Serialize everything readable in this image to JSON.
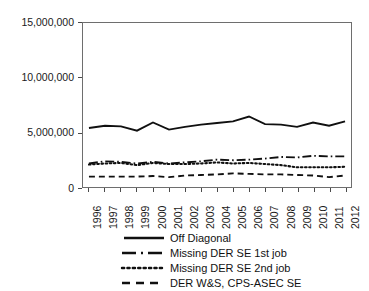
{
  "chart_data": {
    "type": "line",
    "title": "",
    "xlabel": "",
    "ylabel": "",
    "grid": false,
    "legend_position": "bottom",
    "x": [
      1996,
      1997,
      1998,
      1999,
      2000,
      2001,
      2002,
      2003,
      2004,
      2005,
      2006,
      2007,
      2008,
      2009,
      2010,
      2011,
      2012
    ],
    "categories": [
      "1996",
      "1997",
      "1998",
      "1999",
      "2000",
      "2001",
      "2002",
      "2003",
      "2004",
      "2005",
      "2006",
      "2007",
      "2008",
      "2009",
      "2010",
      "2011",
      "2012"
    ],
    "ylim": [
      0,
      15000000
    ],
    "yticks": [
      0,
      5000000,
      10000000,
      15000000
    ],
    "ytick_labels": [
      "0",
      "5,000,000",
      "10,000,000",
      "15,000,000"
    ],
    "series": [
      {
        "name": "Off Diagonal",
        "style": "solid",
        "values": [
          5400000,
          5600000,
          5550000,
          5150000,
          5900000,
          5250000,
          5500000,
          5700000,
          5850000,
          6000000,
          6450000,
          5750000,
          5700000,
          5500000,
          5900000,
          5600000,
          6000000
        ]
      },
      {
        "name": "Missing DER SE 1st job",
        "style": "dash-dot",
        "values": [
          2150000,
          2350000,
          2300000,
          2150000,
          2300000,
          2150000,
          2250000,
          2350000,
          2500000,
          2450000,
          2500000,
          2600000,
          2750000,
          2700000,
          2850000,
          2800000,
          2800000
        ]
      },
      {
        "name": "Missing DER SE 2nd job",
        "style": "dotted",
        "values": [
          2050000,
          2150000,
          2200000,
          2000000,
          2200000,
          2100000,
          2100000,
          2150000,
          2250000,
          2150000,
          2200000,
          2100000,
          2000000,
          1800000,
          1800000,
          1800000,
          1850000
        ]
      },
      {
        "name": "DER W&S, CPS-ASEC SE",
        "style": "dashed",
        "values": [
          950000,
          950000,
          950000,
          950000,
          1000000,
          900000,
          1050000,
          1100000,
          1150000,
          1250000,
          1200000,
          1150000,
          1150000,
          1100000,
          1050000,
          900000,
          1050000
        ]
      }
    ]
  },
  "legend": {
    "items": [
      {
        "label": "Off Diagonal",
        "style": "solid"
      },
      {
        "label": "Missing DER SE 1st job",
        "style": "dash-dot"
      },
      {
        "label": "Missing DER SE 2nd job",
        "style": "dotted"
      },
      {
        "label": "DER W&S, CPS-ASEC SE",
        "style": "dashed"
      }
    ]
  },
  "colors": {
    "line": "#101010",
    "axis": "#6e6e6e",
    "text": "#1a1a1a",
    "background": "#ffffff"
  }
}
